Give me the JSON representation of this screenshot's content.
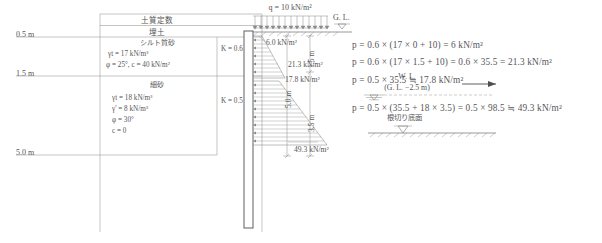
{
  "soil_table": {
    "header": "土質定数",
    "rows": [
      {
        "name": "埋土",
        "depth_label": "0.5 m",
        "k_label": "",
        "params": []
      },
      {
        "name": "シルト質砂",
        "depth_label": "1.5 m",
        "k_label": "K = 0.6",
        "params": [
          "γt = 17 kN/m³",
          "φ = 25°,  c = 40 kN/m²"
        ]
      },
      {
        "name": "細砂",
        "depth_label": "5.0 m",
        "k_label": "K = 0.5",
        "params": [
          "γt = 18 kN/m³",
          "γ' =  8 kN/m³",
          "φ = 30°",
          "c = 0"
        ]
      }
    ]
  },
  "depth_marks": [
    "0.5 m",
    "1.5 m",
    "5.0 m"
  ],
  "dimensions": {
    "upper": "1.5 m",
    "lower": "3.5 m",
    "total": "5.0 m"
  },
  "water_level": {
    "label": "W. L.",
    "sublabel": "(G. L. −2.5 m)"
  },
  "excavation": {
    "label": "根切り底面"
  },
  "surcharge": {
    "label": "q = 10 kN/m²"
  },
  "ground_level": {
    "label": "G. L."
  },
  "pressure_labels": {
    "top": "6.0 kN/m²",
    "upper_bottom": "21.3 kN/m²",
    "lower_top": "17.8 kN/m²",
    "bottom": "49.3 kN/m²"
  },
  "equations": [
    "p = 0.6 × (17 × 0 + 10) = 6 kN/m²",
    "p = 0.6 × (17 × 1.5 + 10) = 0.6 × 35.5 = 21.3 kN/m²",
    "p = 0.5 × 35.5 ≒ 17.8 kN/m²",
    "p = 0.5 × (35.5 + 18 × 3.5) = 0.5 × 98.5 ≒ 49.3 kN/m²"
  ],
  "colors": {
    "line": "#6d6d6d",
    "text": "#555555",
    "wall": "#4f4f4f"
  }
}
